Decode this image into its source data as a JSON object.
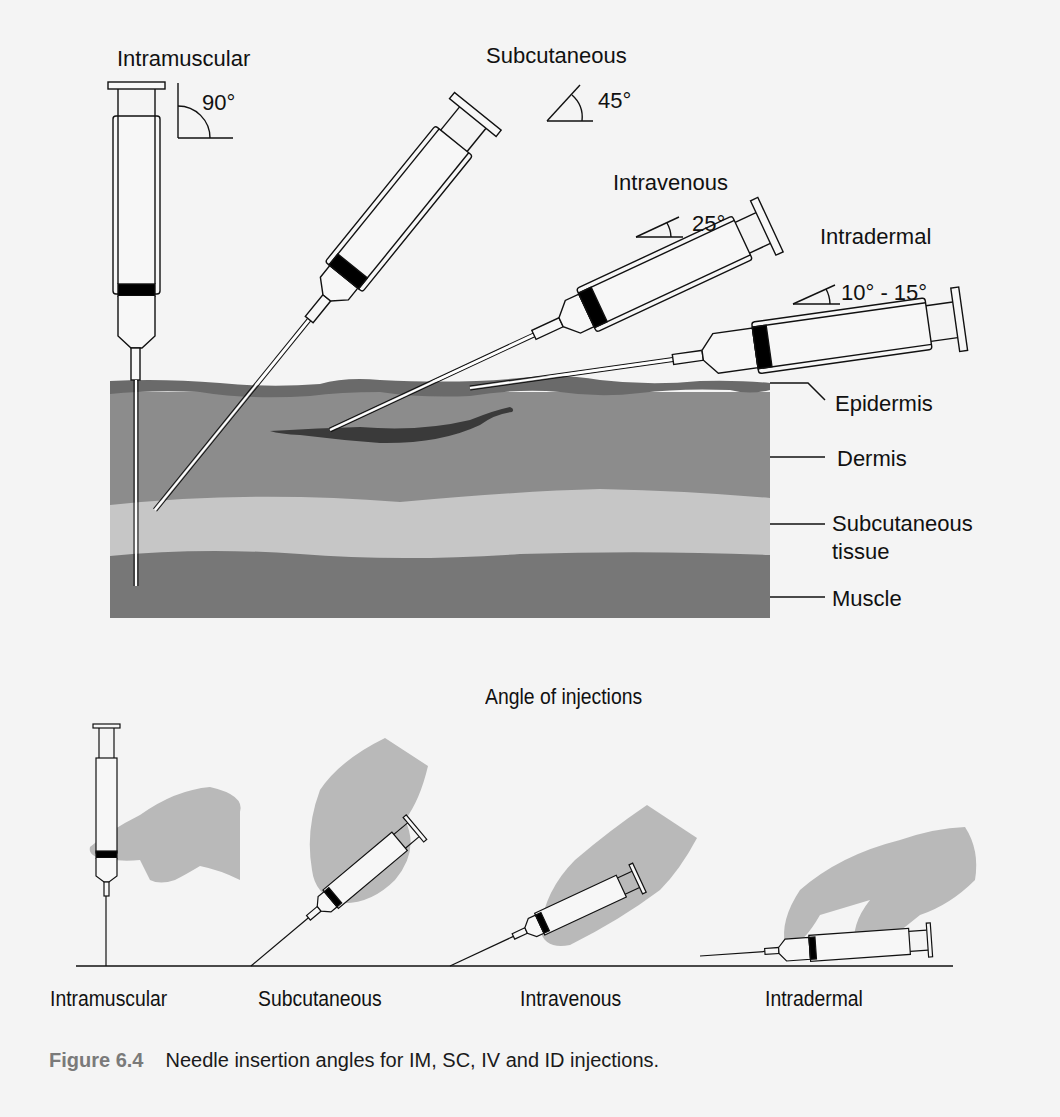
{
  "top_diagram": {
    "syringes": [
      {
        "route": "Intramuscular",
        "angle_label": "90°",
        "angle_deg": 90
      },
      {
        "route": "Subcutaneous",
        "angle_label": "45°",
        "angle_deg": 45
      },
      {
        "route": "Intravenous",
        "angle_label": "25°",
        "angle_deg": 25
      },
      {
        "route": "Intradermal",
        "angle_label": "10° - 15°",
        "angle_deg": "10-15"
      }
    ],
    "layers": [
      {
        "name": "Epidermis",
        "color": "#6e6e6e"
      },
      {
        "name": "Dermis",
        "color": "#8c8c8c"
      },
      {
        "name": "Subcutaneous\ntissue",
        "line1": "Subcutaneous",
        "line2": "tissue",
        "color": "#c6c6c6"
      },
      {
        "name": "Muscle",
        "color": "#777777"
      }
    ],
    "vein_color": "#3c3c3c"
  },
  "bottom_diagram": {
    "title": "Angle of injections",
    "labels": [
      "Intramuscular",
      "Subcutaneous",
      "Intravenous",
      "Intradermal"
    ],
    "hand_color": "#b9b9b9"
  },
  "caption": {
    "figure_number": "Figure 6.4",
    "text": "Needle insertion angles for IM, SC, IV and ID injections."
  }
}
